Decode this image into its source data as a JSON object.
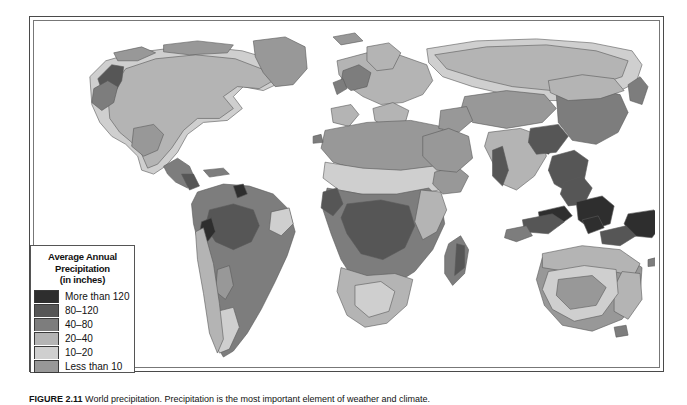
{
  "figure": {
    "caption_label": "FIGURE 2.11",
    "caption_text": "World precipitation. Precipitation is the most important element of weather and climate."
  },
  "legend": {
    "title_line1": "Average Annual",
    "title_line2": "Precipitation",
    "title_line3": "(in inches)",
    "entries": [
      {
        "label": "More than 120",
        "color": "#2e2e2e"
      },
      {
        "label": "80–120",
        "color": "#565656"
      },
      {
        "label": "40–80",
        "color": "#7d7d7d"
      },
      {
        "label": "20–40",
        "color": "#b4b4b4"
      },
      {
        "label": "10–20",
        "color": "#cfcfcf"
      },
      {
        "label": "Less than 10",
        "color": "#989898"
      }
    ]
  },
  "map": {
    "type": "choropleth-world-precipitation",
    "projection": "equal-area world",
    "ocean_color": "#ffffff",
    "outline_color": "#5a5a5a",
    "regions": [
      {
        "name": "greenland",
        "class": "Less than 10"
      },
      {
        "name": "northern-canada-arctic",
        "class": "Less than 10"
      },
      {
        "name": "canada-boreal",
        "class": "10–20"
      },
      {
        "name": "pacific-northwest",
        "class": "80–120"
      },
      {
        "name": "eastern-north-america",
        "class": "20–40"
      },
      {
        "name": "us-southwest-desert",
        "class": "Less than 10"
      },
      {
        "name": "central-america",
        "class": "40–80"
      },
      {
        "name": "amazon-basin",
        "class": "40–80"
      },
      {
        "name": "amazon-core",
        "class": "80–120"
      },
      {
        "name": "colombia-pacific-coast",
        "class": "More than 120"
      },
      {
        "name": "atacama-desert",
        "class": "Less than 10"
      },
      {
        "name": "patagonia",
        "class": "10–20"
      },
      {
        "name": "northeast-brazil",
        "class": "10–20"
      },
      {
        "name": "sahara",
        "class": "Less than 10"
      },
      {
        "name": "sahel",
        "class": "10–20"
      },
      {
        "name": "congo-basin",
        "class": "40–80"
      },
      {
        "name": "west-africa-coast",
        "class": "80–120"
      },
      {
        "name": "east-africa-highlands",
        "class": "20–40"
      },
      {
        "name": "kalahari",
        "class": "10–20"
      },
      {
        "name": "madagascar",
        "class": "40–80"
      },
      {
        "name": "europe",
        "class": "20–40"
      },
      {
        "name": "scandinavia",
        "class": "20–40"
      },
      {
        "name": "arabian-peninsula",
        "class": "Less than 10"
      },
      {
        "name": "central-asia-desert",
        "class": "Less than 10"
      },
      {
        "name": "siberia",
        "class": "10–20"
      },
      {
        "name": "india-west-ghats",
        "class": "80–120"
      },
      {
        "name": "india-interior",
        "class": "20–40"
      },
      {
        "name": "bay-of-bengal-coast",
        "class": "More than 120"
      },
      {
        "name": "southeast-asia",
        "class": "80–120"
      },
      {
        "name": "indonesia-borneo",
        "class": "More than 120"
      },
      {
        "name": "new-guinea",
        "class": "More than 120"
      },
      {
        "name": "eastern-china",
        "class": "40–80"
      },
      {
        "name": "japan",
        "class": "40–80"
      },
      {
        "name": "australia-interior",
        "class": "Less than 10"
      },
      {
        "name": "australia-east-coast",
        "class": "20–40"
      },
      {
        "name": "australia-north",
        "class": "20–40"
      },
      {
        "name": "new-zealand",
        "class": "40–80"
      }
    ]
  }
}
